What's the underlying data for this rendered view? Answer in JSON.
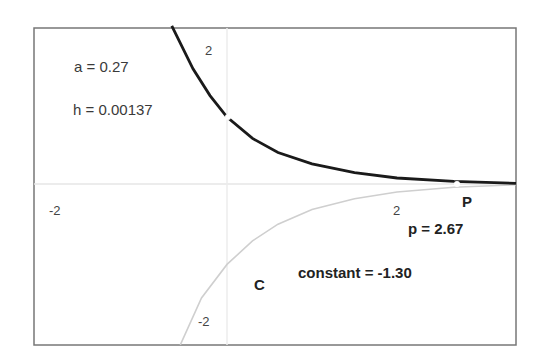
{
  "chart_data": {
    "type": "line",
    "title": "",
    "xlabel": "",
    "ylabel": "",
    "xlim": [
      -2.3,
      3.4
    ],
    "ylim": [
      -2.4,
      2.35
    ],
    "grid": false,
    "axis_ticks": {
      "x": [
        "-2",
        "2"
      ],
      "y": [
        "2",
        "-2"
      ]
    },
    "series": [
      {
        "name": "P",
        "color": "#1a1a1a",
        "style": "solid-thick",
        "x": [
          -0.65,
          -0.4,
          -0.2,
          0.0,
          0.3,
          0.6,
          1.0,
          1.5,
          2.0,
          2.67,
          3.4
        ],
        "y": [
          2.36,
          1.72,
          1.32,
          1.0,
          0.68,
          0.47,
          0.3,
          0.17,
          0.09,
          0.04,
          0.01
        ]
      },
      {
        "name": "C",
        "color": "#c8c8c8",
        "style": "solid-thin",
        "x": [
          -0.55,
          -0.3,
          0.0,
          0.3,
          0.6,
          1.0,
          1.5,
          2.0,
          2.67,
          3.4
        ],
        "y": [
          -2.4,
          -1.7,
          -1.2,
          -0.85,
          -0.6,
          -0.38,
          -0.22,
          -0.12,
          -0.05,
          -0.01
        ]
      }
    ],
    "annotations": [
      {
        "text": "a = 0.27"
      },
      {
        "text": "h = 0.00137"
      },
      {
        "text": "P"
      },
      {
        "text": "p = 2.67"
      },
      {
        "text": "C"
      },
      {
        "text": "constant = -1.30"
      }
    ],
    "parameters": {
      "a": 0.27,
      "h": 0.00137,
      "p": 2.67,
      "constant": -1.3
    }
  },
  "labels": {
    "a": "a = 0.27",
    "h": "h = 0.00137",
    "x_tick_neg": "-2",
    "x_tick_pos": "2",
    "y_tick_pos": "2",
    "y_tick_neg": "-2",
    "point_p": "P",
    "p_value": "p = 2.67",
    "curve_c": "C",
    "constant": "constant = -1.30"
  }
}
